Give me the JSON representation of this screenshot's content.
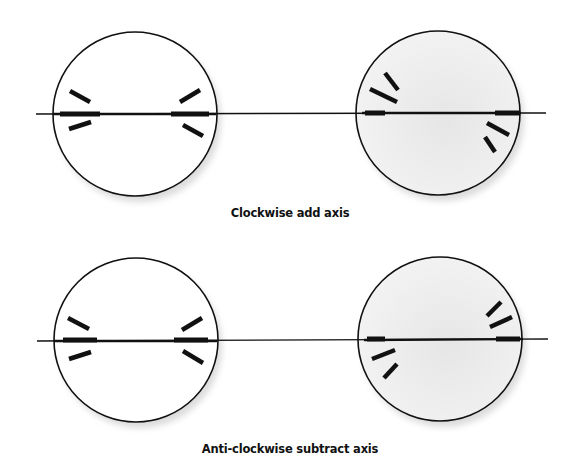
{
  "diagram": {
    "type": "axis-rotation-illustration",
    "colors": {
      "line": "#111111",
      "circle_plain": "#ffffff",
      "circle_shaded": "#ececec",
      "shadow": "#d8d8d8"
    },
    "panels": [
      {
        "caption": "Clockwise add axis",
        "states": [
          {
            "name": "before",
            "shaded": false
          },
          {
            "name": "after",
            "shaded": true
          }
        ]
      },
      {
        "caption": "Anti-clockwise subtract axis",
        "states": [
          {
            "name": "before",
            "shaded": false
          },
          {
            "name": "after",
            "shaded": true
          }
        ]
      }
    ]
  }
}
